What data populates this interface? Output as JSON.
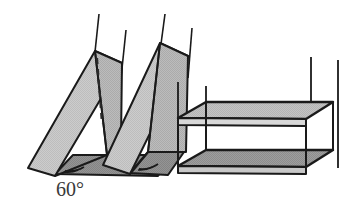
{
  "figure": {
    "background_color": "#ffffff",
    "stroke_color": "#1a1a1a",
    "labels": [
      {
        "id": "incline-angle",
        "text": "60°",
        "x": 56,
        "y": 196,
        "font_size": 20,
        "color": "#3a3a3a"
      }
    ],
    "colors": {
      "outline": "#1a1a1a",
      "ramp_face_light": "#c9c9c9",
      "ramp_face_mid": "#b5b5b5",
      "base_dark": "#8f8f8f",
      "shelf_top_light": "#c2c2c2",
      "shelf_bottom_dark": "#9a9a9a",
      "label_text": "#3a3a3a",
      "hidden_edge": "#2a2a2a"
    },
    "objects": [
      {
        "name": "inclined-plane-left",
        "type": "wedge",
        "angle_degrees": 60,
        "has_hidden_dashed_edge": true,
        "vertical_lines": 2
      },
      {
        "name": "inclined-plane-right",
        "type": "wedge",
        "angle_degrees": 60,
        "has_hidden_dashed_edge": false,
        "vertical_lines": 2
      },
      {
        "name": "shelf-structure",
        "type": "two-tier-box",
        "shelves": 2,
        "vertical_posts": 4
      }
    ]
  }
}
